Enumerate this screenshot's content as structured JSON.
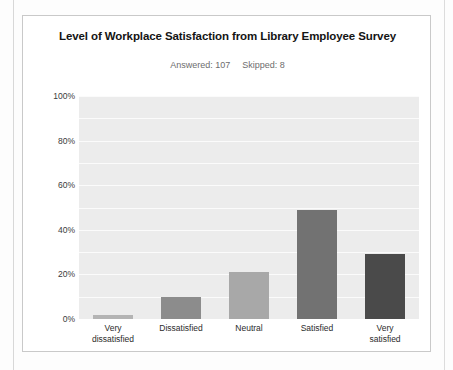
{
  "card": {
    "title": "Level of Workplace Satisfaction from Library Employee Survey",
    "answered_label": "Answered: 107",
    "skipped_label": "Skipped: 8"
  },
  "chart_data": {
    "type": "bar",
    "title": "Level of Workplace Satisfaction from Library Employee Survey",
    "subtitle": "Answered: 107   Skipped: 8",
    "xlabel": "",
    "ylabel": "",
    "categories": [
      "Very dissatisfied",
      "Dissatisfied",
      "Neutral",
      "Satisfied",
      "Very satisfied"
    ],
    "category_lines": [
      [
        "Very",
        "dissatisfied"
      ],
      [
        "Dissatisfied",
        ""
      ],
      [
        "Neutral",
        ""
      ],
      [
        "Satisfied",
        ""
      ],
      [
        "Very",
        "satisfied"
      ]
    ],
    "values": [
      2,
      10,
      21,
      49,
      29
    ],
    "value_labels": [
      "2%",
      "10%",
      "21%",
      "49%",
      "29%"
    ],
    "bar_colors": [
      "#b4b4b4",
      "#8c8c8c",
      "#a8a8a8",
      "#727272",
      "#4a4a4a"
    ],
    "ylim": [
      0,
      100
    ],
    "yticks": [
      0,
      20,
      40,
      60,
      80,
      100
    ],
    "ytick_labels": [
      "0%",
      "20%",
      "40%",
      "60%",
      "80%",
      "100%"
    ],
    "gridlines": [
      10,
      20,
      30,
      40,
      50,
      60,
      70,
      80,
      90,
      100
    ],
    "grid": true,
    "legend": "none",
    "plot_background": "#ececec",
    "gridline_color": "#fbfbfb"
  }
}
